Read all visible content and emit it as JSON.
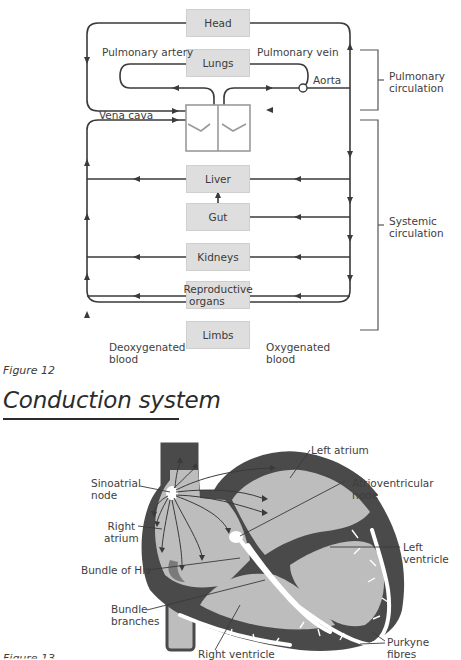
{
  "figure12": {
    "organs": {
      "head": "Head",
      "lungs": "Lungs",
      "liver": "Liver",
      "gut": "Gut",
      "kidneys": "Kidneys",
      "reproductive_line1": "Reproductive",
      "reproductive_line2": "organs",
      "limbs": "Limbs"
    },
    "vessel_labels": {
      "pulmonary_artery": "Pulmonary artery",
      "pulmonary_vein": "Pulmonary vein",
      "aorta": "Aorta",
      "vena_cava": "Vena cava"
    },
    "brackets": {
      "pulmonary_line1": "Pulmonary",
      "pulmonary_line2": "circulation",
      "systemic_line1": "Systemic",
      "systemic_line2": "circulation"
    },
    "blood": {
      "deoxygenated_line1": "Deoxygenated",
      "deoxygenated_line2": "blood",
      "oxygenated_line1": "Oxygenated",
      "oxygenated_line2": "blood"
    },
    "caption": "Figure 12"
  },
  "section": {
    "title": "Conduction system"
  },
  "figure13": {
    "labels": {
      "left_atrium": "Left atrium",
      "sinoatrial_line1": "Sinoatrial",
      "sinoatrial_line2": "node",
      "atrioventricular_line1": "Atrioventricular",
      "atrioventricular_line2": "node",
      "right_atrium_line1": "Right",
      "right_atrium_line2": "atrium",
      "left_ventricle_line1": "Left",
      "left_ventricle_line2": "ventricle",
      "bundle_of_his": "Bundle of His",
      "bundle_branches_line1": "Bundle",
      "bundle_branches_line2": "branches",
      "right_ventricle": "Right ventricle",
      "purkyne_line1": "Purkyne",
      "purkyne_line2": "fibres"
    },
    "caption": "Figure 13"
  },
  "colors": {
    "line": "#3a3a3a",
    "organ_box": "#dedede",
    "heart_wall": "#4a4a4a",
    "heart_chamber": "#bdbdbd",
    "conduction": "#ffffff"
  }
}
